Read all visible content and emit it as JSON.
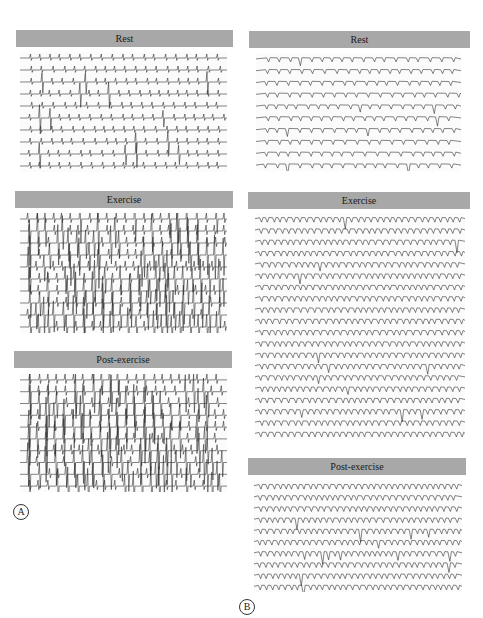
{
  "figure": {
    "panels": [
      {
        "id": "A",
        "label": "A",
        "sections": [
          {
            "title": "Rest",
            "rows": 10,
            "pattern": "sinus-with-pvc"
          },
          {
            "title": "Exercise",
            "rows": 10,
            "pattern": "polymorphic-vt"
          },
          {
            "title": "Post-exercise",
            "rows": 10,
            "pattern": "polymorphic-vt"
          }
        ]
      },
      {
        "id": "B",
        "label": "B",
        "sections": [
          {
            "title": "Rest",
            "rows": 10,
            "pattern": "sinus"
          },
          {
            "title": "Exercise",
            "rows": 20,
            "pattern": "sinus-tachy"
          },
          {
            "title": "Post-exercise",
            "rows": 10,
            "pattern": "sinus-tachy"
          }
        ]
      }
    ],
    "colors": {
      "header_bg": "#a8a8a8",
      "trace": "#333333",
      "background": "#ffffff"
    }
  }
}
